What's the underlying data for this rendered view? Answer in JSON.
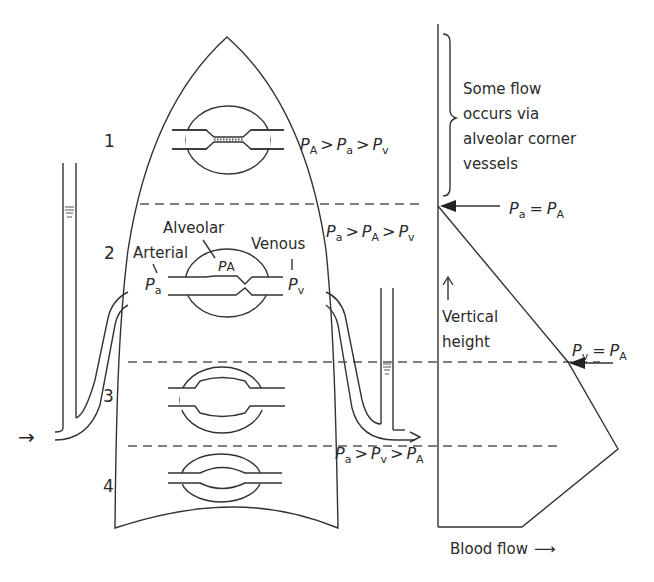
{
  "figure": {
    "zones": [
      {
        "number": "1",
        "relation": {
          "lhs": "P",
          "lhs_sub": "A",
          "op1": ">",
          "mid": "P",
          "mid_sub": "a",
          "op2": ">",
          "rhs": "P",
          "rhs_sub": "v"
        }
      },
      {
        "number": "2",
        "relation": {
          "lhs": "P",
          "lhs_sub": "a",
          "op1": ">",
          "mid": "P",
          "mid_sub": "A",
          "op2": ">",
          "rhs": "P",
          "rhs_sub": "v"
        }
      },
      {
        "number": "3"
      },
      {
        "number": "4",
        "relation": {
          "lhs": "P",
          "lhs_sub": "a",
          "op1": ">",
          "mid": "P",
          "mid_sub": "v",
          "op2": ">",
          "rhs": "P",
          "rhs_sub": "A"
        }
      }
    ],
    "labels": {
      "alveolar": "Alveolar",
      "arterial": "Arterial",
      "venous": "Venous",
      "p": "P",
      "sub_A": "A",
      "sub_a": "a",
      "sub_v": "v"
    },
    "graph": {
      "bracket_note": [
        "Some flow",
        "occurs via",
        "alveolar corner",
        "vessels"
      ],
      "pa_eq_pA": {
        "lhs": "P",
        "lhs_sub": "a",
        "op": "=",
        "rhs": "P",
        "rhs_sub": "A"
      },
      "pv_eq_pA": {
        "lhs": "P",
        "lhs_sub": "v",
        "op": "=",
        "rhs": "P",
        "rhs_sub": "A"
      },
      "y_axis_label": [
        "Vertical",
        "height"
      ],
      "x_axis_label": "Blood flow",
      "x_arrow": "⟶"
    },
    "arrows": {
      "inflow": "→",
      "outflow": "→"
    }
  }
}
